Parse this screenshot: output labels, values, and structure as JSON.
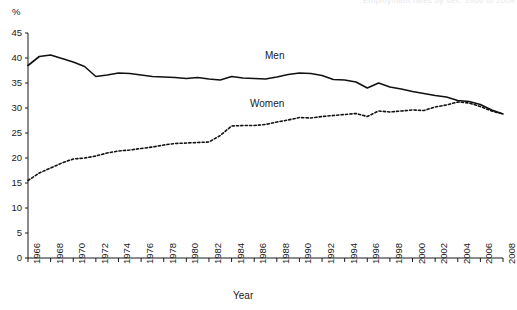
{
  "header": {
    "faint_text": "Employment rates by sex, 1966 to 2008"
  },
  "axes": {
    "y_unit": "%",
    "y_title": "",
    "x_title": "Year",
    "y_ticks": [
      "0",
      "5",
      "10",
      "15",
      "20",
      "25",
      "30",
      "35",
      "40",
      "45"
    ],
    "x_ticks": [
      "1966",
      "1968",
      "1970",
      "1972",
      "1974",
      "1976",
      "1978",
      "1980",
      "1982",
      "1984",
      "1986",
      "1988",
      "1990",
      "1992",
      "1994",
      "1996",
      "1998",
      "2000",
      "2002",
      "2004",
      "2006",
      "2008"
    ]
  },
  "labels": {
    "men": "Men",
    "women": "Women"
  },
  "colors": {
    "line": "#111111",
    "background": "#ffffff",
    "text": "#1a1a1a"
  },
  "chart_data": {
    "type": "line",
    "title": "",
    "subtitle": "",
    "xlabel": "Year",
    "ylabel": "%",
    "xlim": [
      1966,
      2008
    ],
    "ylim": [
      0,
      45
    ],
    "ytick_step": 5,
    "xtick_step": 2,
    "grid": false,
    "legend": "inline-annotations",
    "x": [
      1966,
      1967,
      1968,
      1969,
      1970,
      1971,
      1972,
      1973,
      1974,
      1975,
      1976,
      1977,
      1978,
      1979,
      1980,
      1981,
      1982,
      1983,
      1984,
      1985,
      1986,
      1987,
      1988,
      1989,
      1990,
      1991,
      1992,
      1993,
      1994,
      1995,
      1996,
      1997,
      1998,
      1999,
      2000,
      2001,
      2002,
      2003,
      2004,
      2005,
      2006,
      2007,
      2008
    ],
    "series": [
      {
        "name": "Men",
        "style": "solid",
        "values": [
          38.5,
          40.3,
          40.6,
          39.9,
          39.2,
          38.3,
          36.3,
          36.6,
          37.0,
          36.9,
          36.6,
          36.3,
          36.2,
          36.1,
          35.9,
          36.1,
          35.8,
          35.6,
          36.3,
          36.0,
          35.9,
          35.8,
          36.2,
          36.7,
          37.0,
          36.9,
          36.5,
          35.7,
          35.6,
          35.2,
          34.0,
          35.0,
          34.2,
          33.8,
          33.3,
          32.9,
          32.5,
          32.2,
          31.5,
          31.3,
          30.7,
          29.6,
          28.8
        ]
      },
      {
        "name": "Women",
        "style": "dotted",
        "values": [
          15.5,
          17.0,
          18.0,
          19.0,
          19.8,
          20.0,
          20.4,
          21.0,
          21.4,
          21.6,
          21.9,
          22.2,
          22.6,
          22.9,
          23.0,
          23.1,
          23.2,
          24.5,
          26.4,
          26.5,
          26.5,
          26.7,
          27.2,
          27.6,
          28.1,
          28.0,
          28.3,
          28.5,
          28.7,
          28.9,
          28.3,
          29.4,
          29.2,
          29.4,
          29.6,
          29.5,
          30.2,
          30.6,
          31.2,
          31.0,
          30.3,
          29.4,
          28.8
        ]
      }
    ]
  }
}
